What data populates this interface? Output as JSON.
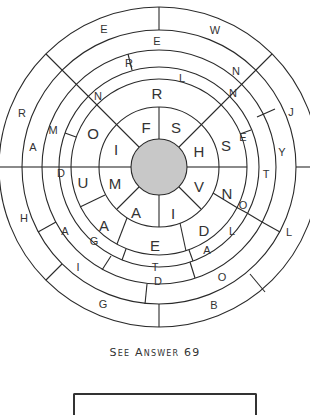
{
  "puzzle": {
    "center": [
      159,
      167
    ],
    "radii": [
      28,
      60,
      88,
      100,
      117,
      137,
      160
    ],
    "center_fill": "#c8c8c8",
    "rings": [
      {
        "name": "ring-1",
        "letters": [
          {
            "t": "F",
            "x": 146,
            "y": 127
          },
          {
            "t": "S",
            "x": 176,
            "y": 127
          },
          {
            "t": "H",
            "x": 199,
            "y": 151
          },
          {
            "t": "V",
            "x": 199,
            "y": 186
          },
          {
            "t": "I",
            "x": 173,
            "y": 213
          },
          {
            "t": "A",
            "x": 136,
            "y": 212
          },
          {
            "t": "M",
            "x": 115,
            "y": 183
          },
          {
            "t": "I",
            "x": 116,
            "y": 149
          }
        ]
      },
      {
        "name": "ring-2",
        "letters": [
          {
            "t": "R",
            "x": 157,
            "y": 93
          },
          {
            "t": "S",
            "x": 226,
            "y": 145
          },
          {
            "t": "N",
            "x": 227,
            "y": 193
          },
          {
            "t": "D",
            "x": 204,
            "y": 230
          },
          {
            "t": "E",
            "x": 155,
            "y": 245
          },
          {
            "t": "A",
            "x": 104,
            "y": 225
          },
          {
            "t": "U",
            "x": 83,
            "y": 182
          },
          {
            "t": "O",
            "x": 93,
            "y": 133
          }
        ]
      },
      {
        "name": "ring-3",
        "letters": [
          {
            "t": "N",
            "x": 98,
            "y": 96
          },
          {
            "t": "N",
            "x": 233,
            "y": 93
          },
          {
            "t": "E",
            "x": 243,
            "y": 137
          },
          {
            "t": "O",
            "x": 243,
            "y": 205
          },
          {
            "t": "L",
            "x": 232,
            "y": 231
          },
          {
            "t": "T",
            "x": 155,
            "y": 267
          },
          {
            "t": "G",
            "x": 94,
            "y": 241
          },
          {
            "t": "D",
            "x": 61,
            "y": 173
          },
          {
            "t": "M",
            "x": 53,
            "y": 130
          }
        ]
      },
      {
        "name": "ring-4",
        "letters": [
          {
            "t": "R",
            "x": 129,
            "y": 63
          },
          {
            "t": "L",
            "x": 182,
            "y": 78
          },
          {
            "t": "T",
            "x": 266,
            "y": 174
          },
          {
            "t": "A",
            "x": 207,
            "y": 250
          },
          {
            "t": "D",
            "x": 158,
            "y": 281
          },
          {
            "t": "A",
            "x": 65,
            "y": 231
          }
        ]
      },
      {
        "name": "ring-5",
        "letters": [
          {
            "t": "E",
            "x": 157,
            "y": 41
          },
          {
            "t": "N",
            "x": 236,
            "y": 71
          },
          {
            "t": "Y",
            "x": 282,
            "y": 152
          },
          {
            "t": "O",
            "x": 222,
            "y": 277
          },
          {
            "t": "I",
            "x": 78,
            "y": 267
          },
          {
            "t": "A",
            "x": 33,
            "y": 147
          }
        ]
      },
      {
        "name": "ring-6",
        "letters": [
          {
            "t": "E",
            "x": 104,
            "y": 29
          },
          {
            "t": "W",
            "x": 215,
            "y": 30
          },
          {
            "t": "J",
            "x": 291,
            "y": 112
          },
          {
            "t": "L",
            "x": 289,
            "y": 232
          },
          {
            "t": "B",
            "x": 214,
            "y": 305
          },
          {
            "t": "G",
            "x": 103,
            "y": 304
          },
          {
            "t": "H",
            "x": 24,
            "y": 218
          },
          {
            "t": "R",
            "x": 22,
            "y": 113
          }
        ]
      }
    ]
  },
  "caption": "See Answer 69"
}
